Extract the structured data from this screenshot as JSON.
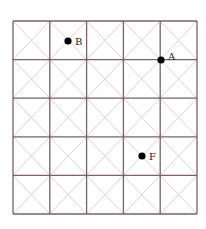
{
  "grid": {
    "rows": 5,
    "cols": 5,
    "origin_x": 13,
    "origin_y": 21,
    "cell_w": 36.8,
    "cell_h": 38.6,
    "line_color": "#7d6069",
    "diagonal_color": "#dcd0d3",
    "diagonals": true
  },
  "points": [
    {
      "label": "B",
      "x": 68,
      "y": 41,
      "label_x": 75,
      "label_y": 45,
      "color": "#000000"
    },
    {
      "label": "A",
      "x": 161,
      "y": 60,
      "label_x": 168,
      "label_y": 60,
      "color": "#000000"
    },
    {
      "label": "F",
      "x": 142,
      "y": 156,
      "label_x": 149,
      "label_y": 160,
      "color": "#000000"
    }
  ]
}
